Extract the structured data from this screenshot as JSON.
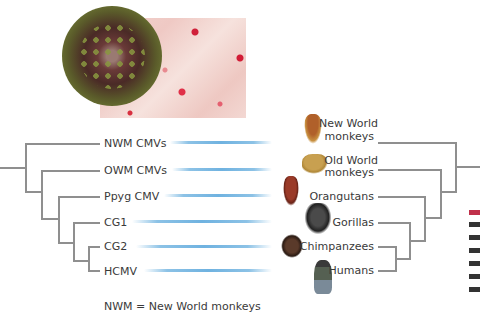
{
  "images": {
    "virus": "cytomegalovirus-particle",
    "tissue": "infected-tissue-micrograph"
  },
  "virus_tree": {
    "leaves": [
      {
        "label": "NWM CMVs"
      },
      {
        "label": "OWM CMVs"
      },
      {
        "label": "Ppyg CMV"
      },
      {
        "label": "CG1"
      },
      {
        "label": "CG2"
      },
      {
        "label": "HCMV"
      }
    ]
  },
  "host_tree": {
    "leaves": [
      {
        "label_line1": "New World",
        "label_line2": "monkeys",
        "icon": "new-world-monkey"
      },
      {
        "label_line1": "Old World",
        "label_line2": "monkeys",
        "icon": "old-world-monkey"
      },
      {
        "label_line1": "Orangutans",
        "icon": "orangutan"
      },
      {
        "label_line1": "Gorillas",
        "icon": "gorilla"
      },
      {
        "label_line1": "Chimpanzees",
        "icon": "chimpanzee"
      },
      {
        "label_line1": "Humans",
        "icon": "human"
      }
    ]
  },
  "colors": {
    "tree_line": "#8f8f8f",
    "association_bar": "#6fb2e0",
    "text": "#3a3a3a"
  },
  "footnote": "NWM = New World monkeys"
}
